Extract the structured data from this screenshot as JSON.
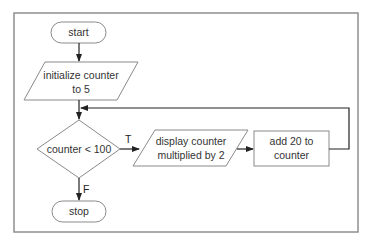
{
  "flowchart": {
    "start": "start",
    "init": [
      "initialize counter",
      "to 5"
    ],
    "decision": "counter < 100",
    "display": [
      "display counter",
      "multiplied by 2"
    ],
    "process": [
      "add 20 to",
      "counter"
    ],
    "stop": "stop",
    "true_label": "T",
    "false_label": "F"
  }
}
